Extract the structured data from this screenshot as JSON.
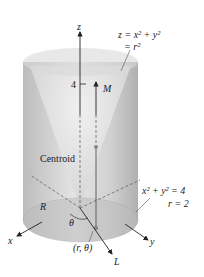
{
  "diagram": {
    "type": "cylinder-with-paraboloid",
    "colors": {
      "cylinder_fill": "#c9c9c9",
      "cylinder_light": "#e6e6e6",
      "base_fill": "#bdbdbd",
      "axis": "#222222",
      "dashed": "#555555",
      "point": "#888888"
    },
    "labels": {
      "z_axis": "z",
      "x_axis": "x",
      "y_axis": "y",
      "height_tick": "4",
      "moment_axis": "M",
      "line_axis": "L",
      "surface_eq_line1": "z = x² + y²",
      "surface_eq_line2": "= r²",
      "centroid": "Centroid",
      "region": "R",
      "angle": "θ",
      "point": "(r, θ)",
      "boundary_eq_line1": "x² + y² = 4",
      "boundary_eq_line2": "r = 2"
    }
  }
}
